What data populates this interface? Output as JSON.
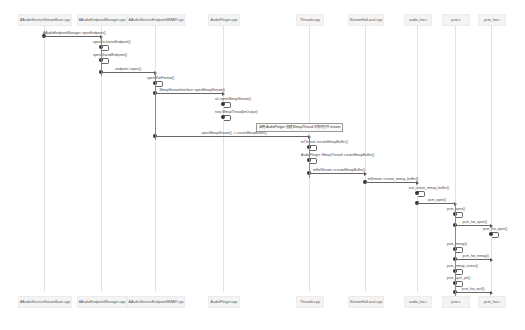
{
  "participants": [
    {
      "name": "AAudioServiceStreamBase.cpp",
      "x": 44
    },
    {
      "name": "AAudioEndpointManager.cpp",
      "x": 101
    },
    {
      "name": "AAudioServiceEndpointMMAP.cpp",
      "x": 155
    },
    {
      "name": "AudioFlinger.cpp",
      "x": 223
    },
    {
      "name": "Threads.cpp",
      "x": 309
    },
    {
      "name": "StreamHalLocal.cpp",
      "x": 365
    },
    {
      "name": "audio_hw.c",
      "x": 417
    },
    {
      "name": "pcm.c",
      "x": 455
    },
    {
      "name": "pcm_hw.c",
      "x": 491
    }
  ],
  "messages": [
    {
      "label": "AAudioEndpointManager::openEndpoint()",
      "from": 44,
      "to": 101,
      "y": 36
    },
    {
      "label": "openExclusiveEndpoint()",
      "self": 101,
      "y": 44
    },
    {
      "label": "openSharedEndpoint()",
      "self": 101,
      "y": 57
    },
    {
      "label": "endpoint->open()",
      "from": 101,
      "to": 155,
      "y": 72
    },
    {
      "label": "openWithFormat()",
      "self": 155,
      "y": 80
    },
    {
      "label": "MmapStreamInterface::openMmapStream()",
      "from": 155,
      "to": 223,
      "y": 93
    },
    {
      "label": "af->openMmapStream()",
      "self": 223,
      "y": 101
    },
    {
      "label": "new MmapThread(mOutput)",
      "self": 223,
      "y": 114
    },
    {
      "label": "openMmapStream() -> createMmapBuffer()",
      "from": 155,
      "to": 309,
      "y": 136
    },
    {
      "label": "mThread->createMmapBuffer()",
      "self": 309,
      "y": 144
    },
    {
      "label": "AudioFlinger::MmapThread::createMmapBuffer()",
      "self": 309,
      "y": 157
    },
    {
      "label": "mHalStream->createMmapBuffer()",
      "from": 309,
      "to": 365,
      "y": 173
    },
    {
      "label": "mStream->create_mmap_buffer()",
      "from": 365,
      "to": 417,
      "y": 182
    },
    {
      "label": "out_create_mmap_buffer()",
      "self": 417,
      "y": 190
    },
    {
      "label": "pcm_open()",
      "from": 417,
      "to": 455,
      "y": 203
    },
    {
      "label": "pcm_open()",
      "self": 455,
      "y": 211
    },
    {
      "label": "pcm_hw_open()",
      "from": 455,
      "to": 491,
      "y": 225
    },
    {
      "label": "pcm_hw_open()",
      "self": 491,
      "y": 231
    },
    {
      "label": "pcm_mmap()",
      "self": 455,
      "y": 246
    },
    {
      "label": "pcm_hw_mmap()",
      "from": 455,
      "to": 491,
      "y": 259
    },
    {
      "label": "pcm_mmap_status()",
      "self": 455,
      "y": 268
    },
    {
      "label": "pcm_sync_ptr()",
      "self": 455,
      "y": 280
    },
    {
      "label": "pcm_hw_ioctl()",
      "from": 455,
      "to": 491,
      "y": 292
    }
  ],
  "note": {
    "label": "调用 AudioFlinger 创建 MmapThread 对象并打开 stream",
    "x": 256,
    "y": 123
  },
  "colors": {
    "line": "#666666",
    "box_bg": "#f4f4f4",
    "lifeline": "#e2e2e2"
  }
}
